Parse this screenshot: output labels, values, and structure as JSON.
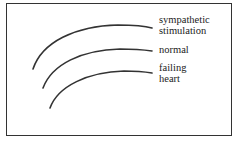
{
  "diagram": {
    "title": "",
    "colors": {
      "line": "#333333",
      "text": "#222222",
      "background": "#ffffff"
    },
    "curves": [
      {
        "name": "sympathetic-stimulation",
        "label_lines": [
          "sympathetic",
          "stimulation"
        ]
      },
      {
        "name": "normal",
        "label_lines": [
          "normal"
        ]
      },
      {
        "name": "failing-heart",
        "label_lines": [
          "failing",
          "heart"
        ]
      }
    ]
  }
}
